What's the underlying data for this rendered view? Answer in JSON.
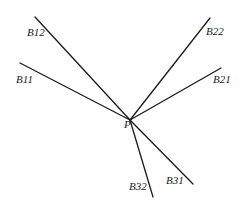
{
  "diagram": {
    "point": {
      "label": "P",
      "x": 130,
      "y": 120,
      "label_x": 124,
      "label_y": 128
    },
    "rays": [
      {
        "id": "B12",
        "label": "B12",
        "x": 35,
        "y": 17,
        "label_x": 27,
        "label_y": 36
      },
      {
        "id": "B11",
        "label": "B11",
        "x": 20,
        "y": 63,
        "label_x": 16,
        "label_y": 83
      },
      {
        "id": "B22",
        "label": "B22",
        "x": 210,
        "y": 18,
        "label_x": 206,
        "label_y": 35
      },
      {
        "id": "B21",
        "label": "B21",
        "x": 221,
        "y": 68,
        "label_x": 213,
        "label_y": 83
      },
      {
        "id": "B32",
        "label": "B32",
        "x": 153,
        "y": 197,
        "label_x": 129,
        "label_y": 190
      },
      {
        "id": "B31",
        "label": "B31",
        "x": 193,
        "y": 184,
        "label_x": 166,
        "label_y": 184
      }
    ],
    "line_color": "#1a1a1a",
    "text_color": "#222222"
  }
}
